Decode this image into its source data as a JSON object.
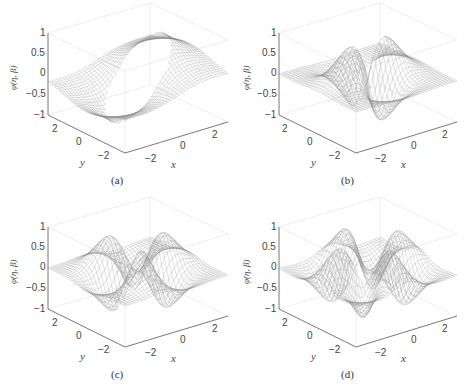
{
  "chart_data": [
    {
      "panel": "a",
      "type": "surface",
      "caption": "(a)",
      "zlabel": "φ(η, β)",
      "xlabel": "x",
      "ylabel": "y",
      "z_ticks": [
        "1",
        "0.5",
        "0",
        "−0.5",
        "−1"
      ],
      "x_ticks": [
        "−2",
        "0",
        "2"
      ],
      "y_ticks": [
        "2",
        "0",
        "−2"
      ],
      "zlim": [
        -1,
        1
      ],
      "xlim": [
        -3,
        3
      ],
      "ylim": [
        -3,
        3
      ],
      "description": "Wireframe mesh surface with a single large circular hole in the center; sheet tilted, rising to ~0.5 at back and dipping to ~-0.8 at front"
    },
    {
      "panel": "b",
      "type": "surface",
      "caption": "(b)",
      "zlabel": "φ(η, β)",
      "xlabel": "x",
      "ylabel": "y",
      "z_ticks": [
        "1",
        "0.5",
        "0",
        "−0.5",
        "−1"
      ],
      "x_ticks": [
        "−2",
        "0",
        "2"
      ],
      "y_ticks": [
        "2",
        "0",
        "−2"
      ],
      "zlim": [
        -1,
        1
      ],
      "xlim": [
        -3,
        3
      ],
      "ylim": [
        -3,
        3
      ],
      "description": "Wireframe mesh with two peaks (~0.8) and two troughs (~-0.8) and an open hole near the back-right"
    },
    {
      "panel": "c",
      "type": "surface",
      "caption": "(c)",
      "zlabel": "φ(η, β)",
      "xlabel": "x",
      "ylabel": "y",
      "z_ticks": [
        "1",
        "0.5",
        "0",
        "−0.5",
        "−1"
      ],
      "x_ticks": [
        "−2",
        "0",
        "2"
      ],
      "y_ticks": [
        "2",
        "0",
        "−2"
      ],
      "zlim": [
        -1,
        1
      ],
      "xlim": [
        -3,
        3
      ],
      "ylim": [
        -3,
        3
      ],
      "description": "Wireframe mesh with three peaks, three troughs and two holes"
    },
    {
      "panel": "d",
      "type": "surface",
      "caption": "(d)",
      "zlabel": "φ(η, β)",
      "xlabel": "x",
      "ylabel": "y",
      "z_ticks": [
        "1",
        "0.5",
        "0",
        "−0.5",
        "−1"
      ],
      "x_ticks": [
        "−2",
        "0",
        "2"
      ],
      "y_ticks": [
        "2",
        "0",
        "−2"
      ],
      "zlim": [
        -1,
        1
      ],
      "xlim": [
        -3,
        3
      ],
      "ylim": [
        -3,
        3
      ],
      "description": "Wireframe mesh with four peaks, four troughs and two holes"
    }
  ],
  "panels": [
    {
      "caption": "(a)",
      "zlabel": "φ(η, β)",
      "xlabel": "x",
      "ylabel": "y",
      "z_ticks": [
        "1",
        "0.5",
        "0",
        "−0.5",
        "−1"
      ],
      "x_ticks": [
        "−2",
        "0",
        "2"
      ],
      "y_ticks": [
        "2",
        "0",
        "−2"
      ]
    },
    {
      "caption": "(b)",
      "zlabel": "φ(η, β)",
      "xlabel": "x",
      "ylabel": "y",
      "z_ticks": [
        "1",
        "0.5",
        "0",
        "−0.5",
        "−1"
      ],
      "x_ticks": [
        "−2",
        "0",
        "2"
      ],
      "y_ticks": [
        "2",
        "0",
        "−2"
      ]
    },
    {
      "caption": "(c)",
      "zlabel": "φ(η, β)",
      "xlabel": "x",
      "ylabel": "y",
      "z_ticks": [
        "1",
        "0.5",
        "0",
        "−0.5",
        "−1"
      ],
      "x_ticks": [
        "−2",
        "0",
        "2"
      ],
      "y_ticks": [
        "2",
        "0",
        "−2"
      ]
    },
    {
      "caption": "(d)",
      "zlabel": "φ(η, β)",
      "xlabel": "x",
      "ylabel": "y",
      "z_ticks": [
        "1",
        "0.5",
        "0",
        "−0.5",
        "−1"
      ],
      "x_ticks": [
        "−2",
        "0",
        "2"
      ],
      "y_ticks": [
        "2",
        "0",
        "−2"
      ]
    }
  ],
  "colors": {
    "mesh": "#8a8a8a",
    "axis": "#555555",
    "grid": "#e6e6e6"
  }
}
